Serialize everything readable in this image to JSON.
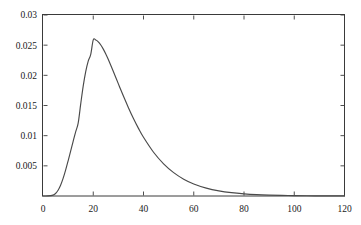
{
  "chart_data": {
    "type": "line",
    "title": "",
    "subtitle": "",
    "xlabel": "",
    "ylabel": "",
    "xlim": [
      0,
      120
    ],
    "ylim": [
      0,
      0.03
    ],
    "grid": false,
    "legend": null,
    "legend_position": "none",
    "background_color": "#ffffff",
    "frame_color": "#3a3a3a",
    "series": [
      {
        "name": "density",
        "color": "#4a4a4a",
        "line_width": 1.15,
        "x": [
          0,
          2,
          4,
          5,
          6,
          7,
          8,
          9,
          10,
          11,
          12,
          13,
          14,
          15,
          16,
          17,
          18,
          19,
          20,
          21,
          22,
          23,
          24,
          25,
          26,
          28,
          30,
          32,
          34,
          36,
          38,
          40,
          44,
          48,
          52,
          56,
          60,
          65,
          70,
          75,
          80,
          85,
          90,
          95,
          100,
          105,
          110,
          115,
          120
        ],
        "y": [
          0.0,
          1e-05,
          0.00015,
          0.00042,
          0.00095,
          0.00178,
          0.00291,
          0.00429,
          0.00583,
          0.00745,
          0.00907,
          0.01063,
          0.01208,
          0.01522,
          0.01822,
          0.02062,
          0.02236,
          0.02348,
          0.02588,
          0.02585,
          0.02555,
          0.02503,
          0.02434,
          0.02352,
          0.02261,
          0.02063,
          0.01858,
          0.01656,
          0.01464,
          0.01285,
          0.01121,
          0.00973,
          0.00725,
          0.00533,
          0.00387,
          0.00279,
          0.002,
          0.00131,
          0.00085,
          0.00055,
          0.00036,
          0.00023,
          0.00015,
          0.0001,
          6e-05,
          4e-05,
          3e-05,
          2e-05,
          1e-05
        ]
      }
    ],
    "x_ticks": [
      {
        "value": 0,
        "label": "0"
      },
      {
        "value": 20,
        "label": "20"
      },
      {
        "value": 40,
        "label": "40"
      },
      {
        "value": 60,
        "label": "60"
      },
      {
        "value": 80,
        "label": "80"
      },
      {
        "value": 100,
        "label": "100"
      },
      {
        "value": 120,
        "label": "120"
      }
    ],
    "y_ticks": [
      {
        "value": 0.005,
        "label": "0.005"
      },
      {
        "value": 0.01,
        "label": "0.01"
      },
      {
        "value": 0.015,
        "label": "0.015"
      },
      {
        "value": 0.02,
        "label": "0.02"
      },
      {
        "value": 0.025,
        "label": "0.025"
      },
      {
        "value": 0.03,
        "label": "0.03"
      }
    ],
    "peak": {
      "x": 20,
      "y": 0.0259
    }
  }
}
